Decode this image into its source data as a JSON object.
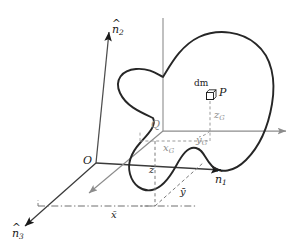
{
  "figure": {
    "type": "rigid-body-kinematics-diagram",
    "background_color": "#ffffff",
    "stroke_color": "#1a1a1a",
    "secondary_stroke_color": "#8c8c8c",
    "width": 304,
    "height": 248
  },
  "labels": {
    "axis_n1": {
      "base": "n",
      "sub": "1",
      "accent": "^",
      "text": "n̂1"
    },
    "axis_n2": {
      "base": "n",
      "sub": "2",
      "accent": "^",
      "text": "n̂2"
    },
    "axis_n3": {
      "base": "n",
      "sub": "3",
      "accent": "^",
      "text": "n̂3"
    },
    "origin": "O",
    "body_point": "Q",
    "mass_element": "dm",
    "particle_point": "P",
    "x_G": {
      "base": "x",
      "sub": "G"
    },
    "y_G": {
      "base": "y",
      "sub": "G"
    },
    "z_G": {
      "base": "z",
      "sub": "G"
    },
    "x_bar": "x̄",
    "y_bar": "ȳ",
    "z_bar": "z̄"
  },
  "geometry": {
    "origin_px": [
      96,
      163
    ],
    "point_Q_px": [
      163,
      131
    ],
    "point_P_px": [
      212,
      95
    ],
    "n1_arrow_tip_px": [
      224,
      170
    ],
    "n2_arrow_tip_px": [
      109,
      30
    ],
    "n3_arrow_tip_px": [
      22,
      228
    ],
    "q_axis_right_tip_px": [
      290,
      131
    ],
    "q_axis_diag_tip_px": [
      86,
      196
    ]
  },
  "colors": {
    "ink": "#1a1a1a",
    "gray_axis": "#8c8c8c",
    "dash_gray": "#9a9a9a",
    "body_outline": "#262626"
  }
}
